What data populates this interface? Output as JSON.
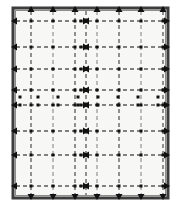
{
  "figure": {
    "canvas": {
      "width": 181,
      "height": 214
    },
    "colors": {
      "page_background": "#ffffff",
      "panel_background": "#f7f7f5",
      "panel_border_outer": "#3d3d3d",
      "panel_border_inner": "#8c8c8c",
      "grid_line": "#5a5a5a",
      "grid_line_light": "#9a9a9a",
      "marker": "#111111",
      "arrow": "#111111"
    },
    "panel": {
      "x": 13,
      "y": 8,
      "width": 155,
      "height": 190,
      "border_width": 3
    },
    "grid": {
      "vertical_line_count": 7,
      "horizontal_line_count": 8,
      "dash_pattern": "4 3",
      "stroke_width": 1.3,
      "vertical_x": [
        31,
        53,
        75,
        97,
        119,
        141,
        163
      ],
      "horizontal_y": [
        21,
        47,
        69,
        90,
        105,
        131,
        155,
        186
      ],
      "center_column_x": 86
    },
    "dot_band": {
      "rows_y": [
        97,
        105
      ],
      "columns_x": [
        20,
        38,
        58,
        78,
        98,
        118,
        138,
        158
      ],
      "note": "dense band of square markers between the two close horizontal rules"
    },
    "arrows": {
      "top_direction": "up",
      "bottom_direction": "down",
      "left_direction": "left",
      "right_direction": "right",
      "center_meets": "horizontal dashed rules terminate with opposing arrowheads at the center column",
      "head_size": 4
    },
    "markers": {
      "shape": "square",
      "size": 3,
      "note": "square dots placed at selected grid intersections and along the center column"
    }
  },
  "chart_data": {
    "type": "diagram",
    "x": [
      31,
      53,
      75,
      97,
      119,
      141,
      163
    ],
    "y": [
      21,
      47,
      69,
      90,
      105,
      131,
      155,
      186
    ],
    "xlabel": "",
    "ylabel": "",
    "grid": true,
    "legend": "none"
  }
}
